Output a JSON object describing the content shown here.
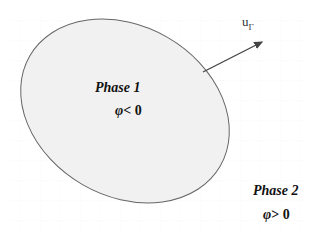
{
  "diagram": {
    "interface_velocity": {
      "base": "u",
      "subscript": "Γ"
    },
    "phase1": {
      "name": "Phase 1",
      "symbol": "φ",
      "relation": "< 0"
    },
    "phase2": {
      "name": "Phase 2",
      "symbol": "φ",
      "relation": "> 0"
    },
    "colors": {
      "ellipse_fill": "#f1f1f1",
      "ellipse_stroke": "#666666",
      "arrow": "#444444",
      "grid": "#e6e6e6"
    }
  }
}
